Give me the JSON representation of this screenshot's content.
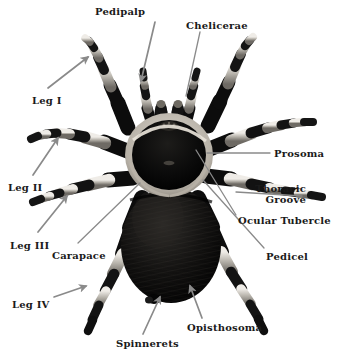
{
  "figure": {
    "background_color": "#ffffff",
    "label_color": "#1a1a1a",
    "leader_color": "#8a8a8a"
  },
  "labels": [
    {
      "id": "pedipalp",
      "text": "Pedipalp",
      "x": 95,
      "y": 6,
      "align": "left"
    },
    {
      "id": "chelicerae",
      "text": "Chelicerae",
      "x": 186,
      "y": 20,
      "align": "left"
    },
    {
      "id": "leg-1",
      "text": "Leg I",
      "x": 32,
      "y": 95,
      "align": "left"
    },
    {
      "id": "prosoma",
      "text": "Prosoma",
      "x": 274,
      "y": 148,
      "align": "left"
    },
    {
      "id": "thoracic-groove",
      "text": "Thoracic",
      "x": 306,
      "y": 183,
      "align": "right",
      "text2": "Groove"
    },
    {
      "id": "leg-2",
      "text": "Leg II",
      "x": 8,
      "y": 182,
      "align": "left"
    },
    {
      "id": "ocular-tubercle",
      "text": "Ocular Tubercle",
      "x": 238,
      "y": 215,
      "align": "left"
    },
    {
      "id": "leg-3",
      "text": "Leg III",
      "x": 10,
      "y": 240,
      "align": "left"
    },
    {
      "id": "carapace",
      "text": "Carapace",
      "x": 52,
      "y": 250,
      "align": "left"
    },
    {
      "id": "pedicel",
      "text": "Pedicel",
      "x": 266,
      "y": 251,
      "align": "left"
    },
    {
      "id": "leg-4",
      "text": "Leg IV",
      "x": 12,
      "y": 299,
      "align": "left"
    },
    {
      "id": "opisthosoma",
      "text": "Opisthosoma",
      "x": 187,
      "y": 322,
      "align": "left"
    },
    {
      "id": "spinnerets",
      "text": "Spinnerets",
      "x": 116,
      "y": 338,
      "align": "left"
    }
  ],
  "leaders": [
    {
      "id": "pedipalp-arrow",
      "kind": "arrow",
      "x1": 155,
      "y1": 22,
      "x2": 141,
      "y2": 81
    },
    {
      "id": "chelicerae-line",
      "kind": "line",
      "x1": 200,
      "y1": 32,
      "x2": 186,
      "y2": 96
    },
    {
      "id": "leg-1-arrow",
      "kind": "arrow",
      "x1": 48,
      "y1": 88,
      "x2": 88,
      "y2": 57
    },
    {
      "id": "prosoma-line",
      "kind": "line",
      "x1": 270,
      "y1": 153,
      "x2": 207,
      "y2": 153
    },
    {
      "id": "thoracic-groove-line",
      "kind": "line",
      "x1": 302,
      "y1": 196,
      "x2": 236,
      "y2": 192
    },
    {
      "id": "leg-2-arrow",
      "kind": "arrow",
      "x1": 33,
      "y1": 175,
      "x2": 58,
      "y2": 138
    },
    {
      "id": "ocular-tubercle-line",
      "kind": "line",
      "x1": 236,
      "y1": 215,
      "x2": 196,
      "y2": 150
    },
    {
      "id": "leg-3-arrow",
      "kind": "arrow",
      "x1": 38,
      "y1": 232,
      "x2": 67,
      "y2": 196
    },
    {
      "id": "carapace-line",
      "kind": "line",
      "x1": 78,
      "y1": 243,
      "x2": 140,
      "y2": 183
    },
    {
      "id": "pedicel-line",
      "kind": "line",
      "x1": 264,
      "y1": 248,
      "x2": 203,
      "y2": 180
    },
    {
      "id": "leg-4-arrow",
      "kind": "arrow",
      "x1": 54,
      "y1": 297,
      "x2": 86,
      "y2": 286
    },
    {
      "id": "opisthosoma-arrow",
      "kind": "arrow",
      "x1": 202,
      "y1": 318,
      "x2": 190,
      "y2": 286
    },
    {
      "id": "spinnerets-arrow",
      "kind": "arrow",
      "x1": 143,
      "y1": 334,
      "x2": 160,
      "y2": 297
    }
  ],
  "anatomy": {
    "prosoma_label": "Prosoma",
    "opisthosoma_label": "Opisthosoma",
    "carapace_label": "Carapace",
    "leg_count": 8,
    "pedipalp_count": 2,
    "colors": {
      "body_dark": "#0d0d0d",
      "leg_dark": "#111111",
      "leg_band_light": "#d8d5d0",
      "leg_band_mid": "#9a968f",
      "carapace_rim": "#cdc8bf"
    }
  }
}
